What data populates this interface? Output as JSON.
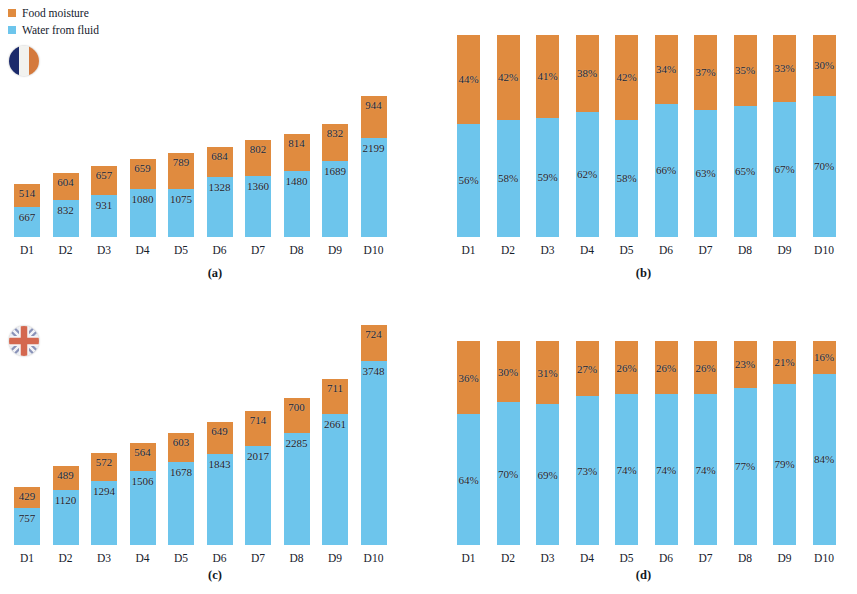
{
  "legend": {
    "items": [
      {
        "label": "Food moisture",
        "color": "#e08b3f",
        "key": "food-moisture"
      },
      {
        "label": "Water from fluid",
        "color": "#6dc5ec",
        "key": "water-from-fluid"
      }
    ]
  },
  "flags": [
    {
      "name": "france-flag-icon",
      "country": "France"
    },
    {
      "name": "united-kingdom-flag-icon",
      "country": "United Kingdom"
    }
  ],
  "colors": {
    "food_moisture": "#e08b3f",
    "water_from_fluid": "#6dc5ec",
    "text": "#16202b",
    "background": "#ffffff"
  },
  "chart_data": [
    {
      "id": "a",
      "type": "bar",
      "stacked": true,
      "title": "(a)",
      "caption": "(a)",
      "country": "France",
      "unit": "ml",
      "xlabel": "",
      "ylabel": "",
      "categories": [
        "D1",
        "D2",
        "D3",
        "D4",
        "D5",
        "D6",
        "D7",
        "D8",
        "D9",
        "D10"
      ],
      "series": [
        {
          "name": "Water from fluid",
          "color": "#6dc5ec",
          "values": [
            667,
            832,
            931,
            1080,
            1075,
            1328,
            1360,
            1480,
            1689,
            2199
          ]
        },
        {
          "name": "Food moisture",
          "color": "#e08b3f",
          "values": [
            514,
            604,
            657,
            659,
            789,
            684,
            802,
            814,
            832,
            944
          ]
        }
      ],
      "totals": [
        1181,
        1436,
        1588,
        1739,
        1864,
        2012,
        2162,
        2294,
        2521,
        3143
      ],
      "ylim": [
        0,
        3143
      ],
      "grid": false,
      "legend_position": "top-left"
    },
    {
      "id": "b",
      "type": "bar",
      "stacked": true,
      "title": "(b)",
      "caption": "(b)",
      "country": "France",
      "unit": "%",
      "xlabel": "",
      "ylabel": "",
      "categories": [
        "D1",
        "D2",
        "D3",
        "D4",
        "D5",
        "D6",
        "D7",
        "D8",
        "D9",
        "D10"
      ],
      "series": [
        {
          "name": "Water from fluid",
          "color": "#6dc5ec",
          "values": [
            56,
            58,
            59,
            62,
            58,
            66,
            63,
            65,
            67,
            70
          ]
        },
        {
          "name": "Food moisture",
          "color": "#e08b3f",
          "values": [
            44,
            42,
            41,
            38,
            42,
            34,
            37,
            35,
            33,
            30
          ]
        }
      ],
      "labels_top": [
        "44%",
        "42%",
        "41%",
        "38%",
        "42%",
        "34%",
        "37%",
        "35%",
        "33%",
        "30%"
      ],
      "labels_bottom": [
        "56%",
        "58%",
        "59%",
        "62%",
        "58%",
        "66%",
        "63%",
        "65%",
        "67%",
        "70%"
      ],
      "ylim": [
        0,
        100
      ],
      "grid": false,
      "legend_position": "none"
    },
    {
      "id": "c",
      "type": "bar",
      "stacked": true,
      "title": "(c)",
      "caption": "(c)",
      "country": "United Kingdom",
      "unit": "ml",
      "xlabel": "",
      "ylabel": "",
      "categories": [
        "D1",
        "D2",
        "D3",
        "D4",
        "D5",
        "D6",
        "D7",
        "D8",
        "D9",
        "D10"
      ],
      "series": [
        {
          "name": "Water from fluid",
          "color": "#6dc5ec",
          "values": [
            757,
            1120,
            1294,
            1506,
            1678,
            1843,
            2017,
            2285,
            2661,
            3748
          ]
        },
        {
          "name": "Food moisture",
          "color": "#e08b3f",
          "values": [
            429,
            489,
            572,
            564,
            603,
            649,
            714,
            700,
            711,
            724
          ]
        }
      ],
      "totals": [
        1186,
        1609,
        1866,
        2070,
        2281,
        2492,
        2731,
        2985,
        3372,
        4472
      ],
      "ylim": [
        0,
        4472
      ],
      "grid": false,
      "legend_position": "none"
    },
    {
      "id": "d",
      "type": "bar",
      "stacked": true,
      "title": "(d)",
      "caption": "(d)",
      "country": "United Kingdom",
      "unit": "%",
      "xlabel": "",
      "ylabel": "",
      "categories": [
        "D1",
        "D2",
        "D3",
        "D4",
        "D5",
        "D6",
        "D7",
        "D8",
        "D9",
        "D10"
      ],
      "series": [
        {
          "name": "Water from fluid",
          "color": "#6dc5ec",
          "values": [
            64,
            70,
            69,
            73,
            74,
            74,
            74,
            77,
            79,
            84
          ]
        },
        {
          "name": "Food moisture",
          "color": "#e08b3f",
          "values": [
            36,
            30,
            31,
            27,
            26,
            26,
            26,
            23,
            21,
            16
          ]
        }
      ],
      "labels_top": [
        "36%",
        "30%",
        "31%",
        "27%",
        "26%",
        "26%",
        "26%",
        "23%",
        "21%",
        "16%"
      ],
      "labels_bottom": [
        "64%",
        "70%",
        "69%",
        "73%",
        "74%",
        "74%",
        "74%",
        "77%",
        "79%",
        "84%"
      ],
      "ylim": [
        0,
        100
      ],
      "grid": false,
      "legend_position": "none"
    }
  ]
}
